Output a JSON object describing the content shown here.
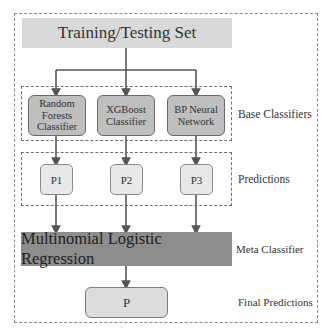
{
  "diagram": {
    "input": {
      "label": "Training/Testing Set"
    },
    "base_classifiers": {
      "group_label": "Base Classifiers",
      "items": [
        {
          "label": "Random Forests Classifier",
          "lines": [
            "Random",
            "Forests",
            "Classifier"
          ]
        },
        {
          "label": "XGBoost Classifier",
          "lines": [
            "XGBoost",
            "Classifier"
          ]
        },
        {
          "label": "BP Neural Network",
          "lines": [
            "BP Neural",
            "Network"
          ]
        }
      ]
    },
    "predictions": {
      "group_label": "Predictions",
      "items": [
        {
          "label": "P1"
        },
        {
          "label": "P2"
        },
        {
          "label": "P3"
        }
      ]
    },
    "meta_classifier": {
      "group_label": "Meta Classifier",
      "label": "Multinomial Logistic Regression"
    },
    "final_predictions": {
      "group_label": "Final Predictions",
      "label": "P"
    },
    "colors": {
      "input_fill": "#d9d9d9",
      "base_fill": "#bfbfbf",
      "prediction_fill": "#e8e8e8",
      "meta_fill": "#8d8d8d",
      "final_fill": "#dcdcdc",
      "arrow": "#555555"
    }
  }
}
